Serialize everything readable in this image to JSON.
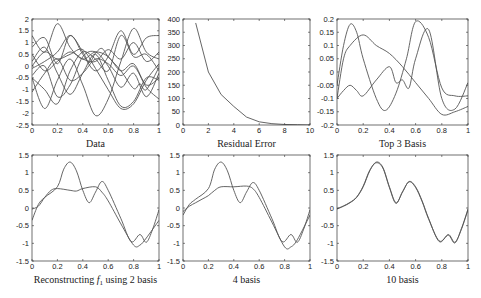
{
  "figure": {
    "line_color": "#555555",
    "axis_color": "#333333"
  },
  "chart_data": [
    {
      "id": "data",
      "type": "line",
      "title": "",
      "xlabel": "Data",
      "ylabel": "",
      "box": [
        32,
        19,
        159,
        125
      ],
      "xlim": [
        0,
        1
      ],
      "ylim": [
        -2.5,
        2
      ],
      "xticks": [
        0,
        0.2,
        0.4,
        0.6,
        0.8,
        1
      ],
      "xticklabels": [
        "0",
        "0.2",
        "0.4",
        "0.6",
        "0.8",
        "1"
      ],
      "yticks": [
        -2.5,
        -2,
        -1.5,
        -1,
        -0.5,
        0,
        0.5,
        1,
        1.5,
        2
      ],
      "yticklabels": [
        "-2.5",
        "-2",
        "-1.5",
        "-1",
        "-0.5",
        "0",
        "0.5",
        "1",
        "1.5",
        "2"
      ],
      "grid": false,
      "series": [
        {
          "name": "f1",
          "x": [
            0,
            0.1,
            0.2,
            0.3,
            0.4,
            0.45,
            0.5,
            0.55,
            0.6,
            0.7,
            0.8,
            0.85,
            0.9,
            1
          ],
          "y": [
            -0.1,
            0.2,
            0.6,
            1.3,
            0.6,
            0.15,
            0.55,
            0.75,
            0.4,
            -0.2,
            -0.95,
            -0.75,
            -1.0,
            -0.05
          ]
        },
        {
          "name": "f2",
          "x": [
            0,
            0.1,
            0.2,
            0.3,
            0.4,
            0.5,
            0.6,
            0.7,
            0.8,
            0.9,
            1
          ],
          "y": [
            1.3,
            0.6,
            1.8,
            0.8,
            0.3,
            0.6,
            0.4,
            -0.2,
            0.1,
            -0.8,
            -0.5
          ]
        },
        {
          "name": "f3",
          "x": [
            0,
            0.1,
            0.2,
            0.3,
            0.4,
            0.5,
            0.6,
            0.7,
            0.8,
            0.9,
            1
          ],
          "y": [
            -0.5,
            -1.8,
            -0.6,
            0.3,
            -0.8,
            -2.1,
            -1.4,
            0.2,
            1.6,
            0.6,
            0.3
          ]
        },
        {
          "name": "f4",
          "x": [
            0,
            0.1,
            0.2,
            0.3,
            0.4,
            0.5,
            0.6,
            0.7,
            0.8,
            0.9,
            1
          ],
          "y": [
            0.8,
            1.2,
            0.1,
            1.3,
            0.5,
            -0.2,
            0.4,
            1.5,
            0.5,
            1.2,
            1.3
          ]
        },
        {
          "name": "f5",
          "x": [
            0,
            0.1,
            0.2,
            0.3,
            0.4,
            0.5,
            0.6,
            0.7,
            0.8,
            0.9,
            1
          ],
          "y": [
            0.2,
            0.8,
            -0.3,
            -1.2,
            -0.3,
            0.5,
            -0.6,
            -1.7,
            -1.5,
            -0.5,
            -0.6
          ]
        },
        {
          "name": "f6",
          "x": [
            0,
            0.1,
            0.2,
            0.3,
            0.4,
            0.5,
            0.6,
            0.7,
            0.8,
            0.9,
            1
          ],
          "y": [
            -0.4,
            0.0,
            -1.3,
            -0.8,
            0.4,
            0.6,
            0.0,
            -0.9,
            -0.3,
            -1.3,
            -0.3
          ]
        },
        {
          "name": "f7",
          "x": [
            0,
            0.1,
            0.2,
            0.3,
            0.4,
            0.5,
            0.6,
            0.7,
            0.8,
            0.9,
            1
          ],
          "y": [
            0.5,
            -0.2,
            0.2,
            0.6,
            0.3,
            0.2,
            0.7,
            0.3,
            1.0,
            0.2,
            0.6
          ]
        },
        {
          "name": "f8",
          "x": [
            0,
            0.1,
            0.2,
            0.3,
            0.4,
            0.5,
            0.6,
            0.7,
            0.8,
            0.9,
            1
          ],
          "y": [
            -1.1,
            -0.3,
            0.3,
            -0.6,
            -0.3,
            0.3,
            0.1,
            -0.4,
            0.0,
            -0.9,
            -1.4
          ]
        },
        {
          "name": "f9",
          "x": [
            0,
            0.1,
            0.2,
            0.3,
            0.4,
            0.5,
            0.6,
            0.7,
            0.8,
            0.9,
            1
          ],
          "y": [
            0.0,
            0.6,
            0.3,
            0.5,
            0.7,
            -0.1,
            -1.0,
            -1.8,
            -1.6,
            -0.6,
            0.1
          ]
        },
        {
          "name": "f10",
          "x": [
            0,
            0.1,
            0.2,
            0.3,
            0.4,
            0.5,
            0.6,
            0.7,
            0.8,
            0.9,
            1
          ],
          "y": [
            -0.5,
            -1.0,
            -1.6,
            -0.2,
            0.6,
            0.3,
            -0.2,
            1.3,
            0.4,
            0.5,
            -0.2
          ]
        }
      ]
    },
    {
      "id": "residual",
      "type": "line",
      "title": "",
      "xlabel": "Residual Error",
      "ylabel": "",
      "box": [
        183,
        19,
        310,
        125
      ],
      "xlim": [
        0,
        10
      ],
      "ylim": [
        0,
        400
      ],
      "xticks": [
        0,
        2,
        4,
        6,
        8,
        10
      ],
      "xticklabels": [
        "0",
        "2",
        "4",
        "6",
        "8",
        "10"
      ],
      "yticks": [
        0,
        50,
        100,
        150,
        200,
        250,
        300,
        350,
        400
      ],
      "yticklabels": [
        "0",
        "50",
        "100",
        "150",
        "200",
        "250",
        "300",
        "350",
        "400"
      ],
      "grid": false,
      "series": [
        {
          "name": "residual",
          "x": [
            1,
            2,
            3,
            4,
            5,
            6,
            7,
            8,
            9,
            10
          ],
          "y": [
            385,
            200,
            115,
            70,
            30,
            12,
            5,
            2,
            1,
            0
          ]
        }
      ]
    },
    {
      "id": "top3",
      "type": "line",
      "title": "",
      "xlabel": "Top 3 Basis",
      "ylabel": "",
      "box": [
        337,
        19,
        468,
        125
      ],
      "xlim": [
        0,
        1
      ],
      "ylim": [
        -0.2,
        0.2
      ],
      "xticks": [
        0,
        0.2,
        0.4,
        0.6,
        0.8,
        1
      ],
      "xticklabels": [
        "0",
        "0.2",
        "0.4",
        "0.6",
        "0.8",
        "1"
      ],
      "yticks": [
        -0.2,
        -0.15,
        -0.1,
        -0.05,
        0,
        0.05,
        0.1,
        0.15,
        0.2
      ],
      "yticklabels": [
        "-0.2",
        "-0.15",
        "-0.1",
        "-0.05",
        "0",
        "0.05",
        "0.1",
        "0.15",
        "0.2"
      ],
      "grid": false,
      "series": [
        {
          "name": "basis1",
          "x": [
            0,
            0.05,
            0.1,
            0.2,
            0.3,
            0.4,
            0.5,
            0.6,
            0.7,
            0.8,
            0.9,
            1
          ],
          "y": [
            -0.1,
            0.05,
            0.1,
            0.14,
            0.1,
            0.07,
            0.02,
            -0.04,
            -0.1,
            -0.16,
            -0.15,
            -0.13
          ]
        },
        {
          "name": "basis2",
          "x": [
            0,
            0.05,
            0.1,
            0.15,
            0.2,
            0.3,
            0.37,
            0.45,
            0.53,
            0.6,
            0.7,
            0.8,
            0.9,
            1
          ],
          "y": [
            -0.05,
            0.1,
            0.18,
            0.15,
            0.05,
            -0.1,
            -0.145,
            -0.08,
            0.05,
            0.19,
            0.13,
            -0.06,
            -0.09,
            -0.09
          ]
        },
        {
          "name": "basis3",
          "x": [
            0,
            0.05,
            0.1,
            0.15,
            0.2,
            0.3,
            0.4,
            0.45,
            0.5,
            0.55,
            0.6,
            0.7,
            0.8,
            0.9,
            1
          ],
          "y": [
            -0.1,
            -0.07,
            -0.05,
            -0.07,
            -0.09,
            -0.03,
            0.02,
            -0.04,
            -0.03,
            -0.06,
            0.05,
            0.16,
            -0.1,
            -0.14,
            -0.04
          ]
        }
      ]
    },
    {
      "id": "recon2",
      "type": "line",
      "title": "",
      "xlabel": "Reconstructing f1 using 2 basis",
      "xlabel_main": "Reconstructing ",
      "xlabel_sym": "f",
      "xlabel_sub": "1",
      "xlabel_tail": " using 2 basis",
      "ylabel": "",
      "box": [
        32,
        155,
        159,
        261
      ],
      "xlim": [
        0,
        1
      ],
      "ylim": [
        -1.5,
        1.5
      ],
      "xticks": [
        0,
        0.2,
        0.4,
        0.6,
        0.8,
        1
      ],
      "xticklabels": [
        "0",
        "0.2",
        "0.4",
        "0.6",
        "0.8",
        "1"
      ],
      "yticks": [
        -1.5,
        -1,
        -0.5,
        0,
        0.5,
        1,
        1.5
      ],
      "yticklabels": [
        "-1.5",
        "-1",
        "-0.5",
        "0",
        "0.5",
        "1",
        "1.5"
      ],
      "grid": false,
      "series": [
        {
          "name": "original",
          "x": [
            0,
            0.05,
            0.1,
            0.2,
            0.25,
            0.3,
            0.35,
            0.4,
            0.45,
            0.5,
            0.55,
            0.6,
            0.7,
            0.78,
            0.85,
            0.9,
            0.95,
            1
          ],
          "y": [
            -0.35,
            0.1,
            0.3,
            0.6,
            1.1,
            1.3,
            1.05,
            0.5,
            0.15,
            0.45,
            0.75,
            0.5,
            -0.3,
            -0.95,
            -0.75,
            -0.97,
            -0.6,
            -0.05
          ]
        },
        {
          "name": "reconstruction",
          "x": [
            0,
            0.05,
            0.1,
            0.15,
            0.2,
            0.3,
            0.35,
            0.4,
            0.5,
            0.55,
            0.6,
            0.7,
            0.8,
            0.85,
            0.9,
            1
          ],
          "y": [
            -0.03,
            0.05,
            0.3,
            0.5,
            0.55,
            0.5,
            0.48,
            0.55,
            0.6,
            0.45,
            0.2,
            -0.45,
            -1.05,
            -1.05,
            -0.85,
            -0.35
          ]
        }
      ]
    },
    {
      "id": "recon4",
      "type": "line",
      "title": "",
      "xlabel": "4 basis",
      "ylabel": "",
      "box": [
        183,
        155,
        310,
        261
      ],
      "xlim": [
        0,
        1
      ],
      "ylim": [
        -1.5,
        1.5
      ],
      "xticks": [
        0,
        0.2,
        0.4,
        0.6,
        0.8,
        1
      ],
      "xticklabels": [
        "0",
        "0.2",
        "0.4",
        "0.6",
        "0.8",
        "1"
      ],
      "yticks": [
        -1.5,
        -1,
        -0.5,
        0,
        0.5,
        1,
        1.5
      ],
      "yticklabels": [
        "-1.5",
        "-1",
        "-0.5",
        "0",
        "0.5",
        "1",
        "1.5"
      ],
      "grid": false,
      "series": [
        {
          "name": "original",
          "x": [
            0,
            0.05,
            0.1,
            0.2,
            0.25,
            0.3,
            0.35,
            0.4,
            0.45,
            0.5,
            0.55,
            0.6,
            0.7,
            0.78,
            0.85,
            0.9,
            0.95,
            1
          ],
          "y": [
            -0.2,
            0.1,
            0.25,
            0.55,
            1.1,
            1.3,
            1.05,
            0.5,
            0.15,
            0.45,
            0.72,
            0.5,
            -0.3,
            -0.95,
            -0.75,
            -0.97,
            -0.6,
            -0.05
          ]
        },
        {
          "name": "reconstruction",
          "x": [
            0,
            0.05,
            0.1,
            0.15,
            0.2,
            0.25,
            0.3,
            0.4,
            0.5,
            0.55,
            0.6,
            0.7,
            0.8,
            0.85,
            0.9,
            1
          ],
          "y": [
            -0.1,
            0.05,
            0.15,
            0.25,
            0.35,
            0.5,
            0.6,
            0.6,
            0.62,
            0.55,
            0.3,
            -0.4,
            -1.1,
            -1.1,
            -0.9,
            -0.2
          ]
        }
      ]
    },
    {
      "id": "recon10",
      "type": "line",
      "title": "",
      "xlabel": "10 basis",
      "ylabel": "",
      "box": [
        337,
        155,
        468,
        261
      ],
      "xlim": [
        0,
        1
      ],
      "ylim": [
        -1.5,
        1.5
      ],
      "xticks": [
        0,
        0.2,
        0.4,
        0.6,
        0.8,
        1
      ],
      "xticklabels": [
        "0",
        "0.2",
        "0.4",
        "0.6",
        "0.8",
        "1"
      ],
      "yticks": [
        -1.5,
        -1,
        -0.5,
        0,
        0.5,
        1,
        1.5
      ],
      "yticklabels": [
        "-1.5",
        "-1",
        "-0.5",
        "0",
        "0.5",
        "1",
        "1.5"
      ],
      "grid": false,
      "series": [
        {
          "name": "original",
          "x": [
            0,
            0.05,
            0.1,
            0.15,
            0.2,
            0.25,
            0.3,
            0.35,
            0.4,
            0.45,
            0.5,
            0.55,
            0.6,
            0.65,
            0.7,
            0.78,
            0.85,
            0.9,
            0.95,
            1
          ],
          "y": [
            -0.03,
            0.05,
            0.15,
            0.3,
            0.6,
            1.05,
            1.3,
            1.15,
            0.6,
            0.15,
            0.45,
            0.75,
            0.6,
            0.2,
            -0.3,
            -0.95,
            -0.75,
            -0.97,
            -0.6,
            -0.05
          ]
        },
        {
          "name": "reconstruction",
          "x": [
            0,
            0.05,
            0.1,
            0.15,
            0.2,
            0.25,
            0.3,
            0.35,
            0.4,
            0.45,
            0.5,
            0.55,
            0.6,
            0.65,
            0.7,
            0.78,
            0.85,
            0.9,
            0.95,
            1
          ],
          "y": [
            -0.02,
            0.06,
            0.16,
            0.31,
            0.62,
            1.07,
            1.28,
            1.13,
            0.58,
            0.13,
            0.46,
            0.74,
            0.58,
            0.18,
            -0.32,
            -0.93,
            -0.77,
            -0.99,
            -0.58,
            -0.03
          ]
        }
      ]
    }
  ]
}
